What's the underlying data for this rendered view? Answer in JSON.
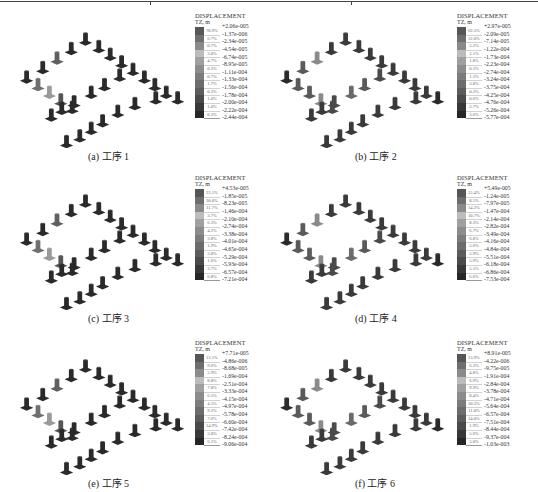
{
  "figure": {
    "legend_title": "DISPLACEMENT",
    "legend_unit": "TZ, m",
    "panels": [
      {
        "caption": "(a) 工序 1",
        "label": "a",
        "step": "工序 1",
        "max": "+2.06e-005",
        "percents": [
          "78.9%",
          "6.7%",
          "0.7%",
          "3.0%",
          "4.7%",
          "0.3%",
          "0.7%",
          "1.7%",
          "0.3%",
          "1.0%",
          "1.0%",
          "0.3%"
        ],
        "values": [
          "-1.37e-006",
          "-2.34e-005",
          "-4.54e-005",
          "-6.74e-005",
          "-8.95e-005",
          "-1.11e-004",
          "-1.33e-004",
          "-1.56e-004",
          "-1.78e-004",
          "-2.00e-004",
          "-2.22e-004",
          "-2.44e-004"
        ]
      },
      {
        "caption": "(b) 工序 2",
        "label": "b",
        "step": "工序 2",
        "max": "+2.97e-005",
        "percents": [
          "62.5%",
          "12.0%",
          "5.2%",
          "2.1%",
          "1.8%",
          "0.3%",
          "1.3%",
          "3.8%",
          "0.3%",
          "0.6%",
          "2.7%",
          "3.6%"
        ],
        "values": [
          "-2.09e-005",
          "-7.14e-005",
          "-1.22e-004",
          "-1.73e-004",
          "-2.23e-004",
          "-2.74e-004",
          "-3.24e-004",
          "-3.75e-004",
          "-4.25e-004",
          "-4.76e-004",
          "-5.26e-004",
          "-5.77e-004"
        ]
      },
      {
        "caption": "(c) 工序 3",
        "label": "c",
        "step": "工序 3",
        "max": "+4.53e-005",
        "percents": [
          "23.1%",
          "30.0%",
          "11.7%",
          "3.7%",
          "6.3%",
          "4.2%",
          "3.8%",
          "1.9%",
          "3.8%",
          "1.6%",
          "3.7%",
          "6.8%"
        ],
        "values": [
          "-1.85e-005",
          "-8.23e-005",
          "-1.46e-004",
          "-2.10e-004",
          "-2.74e-004",
          "-3.38e-004",
          "-4.01e-004",
          "-4.65e-004",
          "-5.29e-004",
          "-5.93e-004",
          "-6.57e-004",
          "-7.21e-004"
        ]
      },
      {
        "caption": "(d) 工序 4",
        "label": "d",
        "step": "工序 4",
        "max": "+5.49e-005",
        "percents": [
          "15.4%",
          "8.5%",
          "14.2%",
          "10.7%",
          "8.3%",
          "6.7%",
          "6.8%",
          "5.6%",
          "5.9%",
          "5.9%",
          "5.5%",
          "6.6%"
        ],
        "values": [
          "-1.24e-005",
          "-7.97e-005",
          "-1.47e-004",
          "-2.14e-004",
          "-2.82e-004",
          "-3.49e-004",
          "-4.16e-004",
          "-4.84e-004",
          "-5.51e-004",
          "-6.18e-004",
          "-6.86e-004",
          "-7.53e-004"
        ]
      },
      {
        "caption": "(e) 工序 5",
        "label": "e",
        "step": "工序 5",
        "max": "+7.71e-005",
        "percents": [
          "13.1%",
          "9.6%",
          "5.9%",
          "8.8%",
          "7.8%",
          "6.5%",
          "4.5%",
          "9.2%",
          "7.6%",
          "14.9%",
          "3.8%",
          "6.1%"
        ],
        "values": [
          "-4.86e-006",
          "-8.68e-005",
          "-1.69e-004",
          "-2.51e-004",
          "-3.33e-004",
          "-4.15e-004",
          "-4.97e-004",
          "-5.78e-004",
          "-6.60e-004",
          "-7.42e-004",
          "-8.24e-004",
          "-9.06e-004"
        ]
      },
      {
        "caption": "(f) 工序 6",
        "label": "f",
        "step": "工序 6",
        "max": "+8.91e-005",
        "percents": [
          "13.9%",
          "6.3%",
          "4.8%",
          "6.9%",
          "9.9%",
          "8.4%",
          "10.3%",
          "11.0%",
          "14.0%",
          "1.9%",
          "5.6%",
          "5.0%"
        ],
        "values": [
          "-4.22e-006",
          "-9.75e-005",
          "-1.91e-004",
          "-2.84e-004",
          "-3.78e-004",
          "-4.71e-004",
          "-5.64e-004",
          "-6.57e-004",
          "-7.51e-004",
          "-8.44e-004",
          "-9.37e-004",
          "-1.03e-003"
        ]
      }
    ],
    "colors": {
      "swatches": [
        "#565656",
        "#6e6e6e",
        "#8a8a8a",
        "#bcbcbc",
        "#a0a0a0",
        "#8c8c8c",
        "#7c7c7c",
        "#6c6c6c",
        "#5c5c5c",
        "#4a4a4a",
        "#383838",
        "#262626"
      ],
      "pedestal_dark": "#2a2a2a",
      "pedestal_mid": "#555555",
      "pedestal_light": "#9a9a9a"
    }
  }
}
